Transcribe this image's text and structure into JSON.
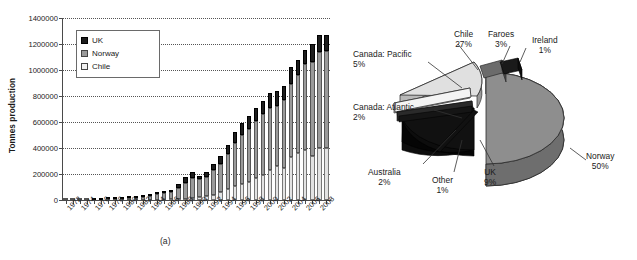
{
  "figure": {
    "caption_a": "(a)",
    "caption_b": "(b)"
  },
  "chart_data": [
    {
      "type": "bar",
      "id": "panel-a",
      "title": "",
      "subtitle": "",
      "xlabel": "",
      "ylabel": "Tonnes production",
      "ylim": [
        0,
        1400000
      ],
      "ytick_step": 200000,
      "yticks": [
        "0",
        "200000",
        "400000",
        "600000",
        "800000",
        "1000000",
        "1200000",
        "1400000"
      ],
      "grid": true,
      "stacked": true,
      "legend_position": "top-left",
      "legend": [
        "UK",
        "Norway",
        "Chile"
      ],
      "colors": {
        "UK": "#1d1d1d",
        "Norway": "#9a9a9a",
        "Chile": "#e3e3e3"
      },
      "categories": [
        "1972",
        "1973",
        "1974",
        "1975",
        "1976",
        "1977",
        "1978",
        "1979",
        "1980",
        "1981",
        "1982",
        "1983",
        "1984",
        "1985",
        "1986",
        "1987",
        "1988",
        "1989",
        "1990",
        "1991",
        "1992",
        "1993",
        "1994",
        "1995",
        "1996",
        "1997",
        "1998",
        "1999",
        "2000",
        "2001",
        "2002",
        "2003",
        "2004",
        "2005",
        "2006",
        "2007",
        "2008",
        "2009"
      ],
      "tick_labels": [
        "1972",
        "1974",
        "1976",
        "1978",
        "1980",
        "1982",
        "1984",
        "1986",
        "1988",
        "1990",
        "1992",
        "1994",
        "1996",
        "1998",
        "2000",
        "2002",
        "2004",
        "2006",
        "2008"
      ],
      "series": [
        {
          "name": "Chile",
          "values": [
            0,
            0,
            0,
            0,
            0,
            0,
            0,
            0,
            0,
            0,
            0,
            0,
            1000,
            2000,
            3000,
            4000,
            6000,
            9000,
            12000,
            20000,
            30000,
            40000,
            60000,
            85000,
            110000,
            120000,
            140000,
            170000,
            190000,
            230000,
            260000,
            250000,
            330000,
            360000,
            385000,
            340000,
            400000,
            400000
          ]
        },
        {
          "name": "Norway",
          "values": [
            100,
            200,
            500,
            1000,
            2000,
            3000,
            5000,
            7000,
            9000,
            12000,
            18000,
            25000,
            32000,
            42000,
            50000,
            55000,
            85000,
            120000,
            160000,
            140000,
            150000,
            190000,
            220000,
            270000,
            330000,
            380000,
            410000,
            440000,
            470000,
            480000,
            460000,
            520000,
            560000,
            600000,
            660000,
            720000,
            740000,
            750000
          ]
        },
        {
          "name": "UK",
          "values": [
            0,
            0,
            0,
            0,
            100,
            200,
            400,
            700,
            1000,
            1500,
            2000,
            3000,
            4000,
            6000,
            8000,
            10000,
            30000,
            45000,
            45000,
            25000,
            35000,
            45000,
            60000,
            70000,
            85000,
            90000,
            95000,
            100000,
            100000,
            110000,
            120000,
            110000,
            130000,
            120000,
            110000,
            140000,
            130000,
            120000
          ]
        }
      ]
    },
    {
      "type": "pie",
      "id": "panel-b",
      "title": "",
      "exploded": true,
      "three_d": true,
      "labels": [
        "Norway",
        "Chile",
        "UK",
        "Canada: Pacific",
        "Faroes",
        "Canada: Atlantic",
        "Australia",
        "Ireland",
        "Other"
      ],
      "values": [
        50,
        27,
        9,
        5,
        3,
        2,
        2,
        1,
        1
      ],
      "label_suffix": "%",
      "slices": [
        {
          "name": "Norway",
          "pct": "50%",
          "color": "#8e8e8e"
        },
        {
          "name": "Chile",
          "pct": "27%",
          "color": "#e0e0e0"
        },
        {
          "name": "UK",
          "pct": "9%",
          "color": "#0d0d0d"
        },
        {
          "name": "Canada: Pacific",
          "pct": "5%",
          "color": "#f4f4f4"
        },
        {
          "name": "Faroes",
          "pct": "3%",
          "color": "#6b6b6b"
        },
        {
          "name": "Canada: Atlantic",
          "pct": "2%",
          "color": "#2a2a2a"
        },
        {
          "name": "Australia",
          "pct": "2%",
          "color": "#151515"
        },
        {
          "name": "Ireland",
          "pct": "1%",
          "color": "#1a1a1a"
        },
        {
          "name": "Other",
          "pct": "1%",
          "color": "#111111"
        }
      ]
    }
  ]
}
